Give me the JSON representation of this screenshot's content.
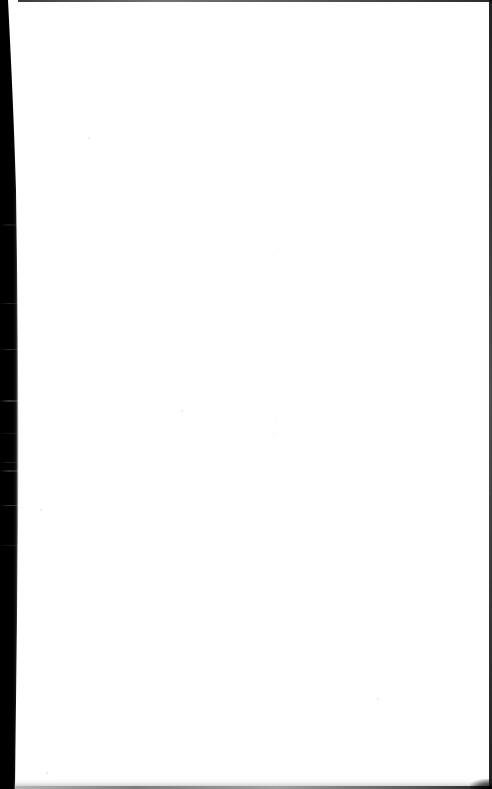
{
  "document": {
    "kind": "scanned-page",
    "page_state": "blank",
    "page_text": "",
    "has_text": false,
    "has_figures": false,
    "has_tables": false,
    "canvas": {
      "width_px": 492,
      "height_px": 789
    }
  },
  "colors": {
    "paper": "#fefefe",
    "page_background": "#ffffff",
    "gutter_shadow": "#000000",
    "edge_line": "#171717",
    "streak_noise": "#969696",
    "bottom_haze": "#8c8c8c"
  },
  "artifacts": {
    "gutter_shadow": {
      "name": "left-gutter-shadow",
      "edge": "left",
      "description": "black scanner spine shadow wedge",
      "width_top_px": 8,
      "width_max_px": 18,
      "width_bottom_px": 15,
      "widest_at_y_px": 460
    },
    "streaks": {
      "name": "horizontal-scan-streaks",
      "description": "faint grey horizontal noise bands inside the dark gutter",
      "count": 9,
      "y_positions_px": [
        224,
        303,
        349,
        400,
        433,
        462,
        470,
        505,
        545
      ]
    },
    "edges": [
      {
        "name": "top-edge-line",
        "side": "top",
        "thickness_px": 2
      },
      {
        "name": "right-edge-line",
        "side": "right",
        "thickness_px": 3
      },
      {
        "name": "bottom-edge-line",
        "side": "bottom",
        "thickness_px": 3
      }
    ],
    "specks": [
      {
        "x_px": 88,
        "y_px": 137,
        "size_px": 2
      },
      {
        "x_px": 181,
        "y_px": 410,
        "size_px": 2
      },
      {
        "x_px": 276,
        "y_px": 421,
        "size_px": 1
      },
      {
        "x_px": 274,
        "y_px": 433,
        "size_px": 1
      },
      {
        "x_px": 273,
        "y_px": 253,
        "size_px": 1
      },
      {
        "x_px": 377,
        "y_px": 698,
        "size_px": 2
      },
      {
        "x_px": 46,
        "y_px": 772,
        "size_px": 2
      },
      {
        "x_px": 40,
        "y_px": 509,
        "size_px": 2
      }
    ]
  }
}
